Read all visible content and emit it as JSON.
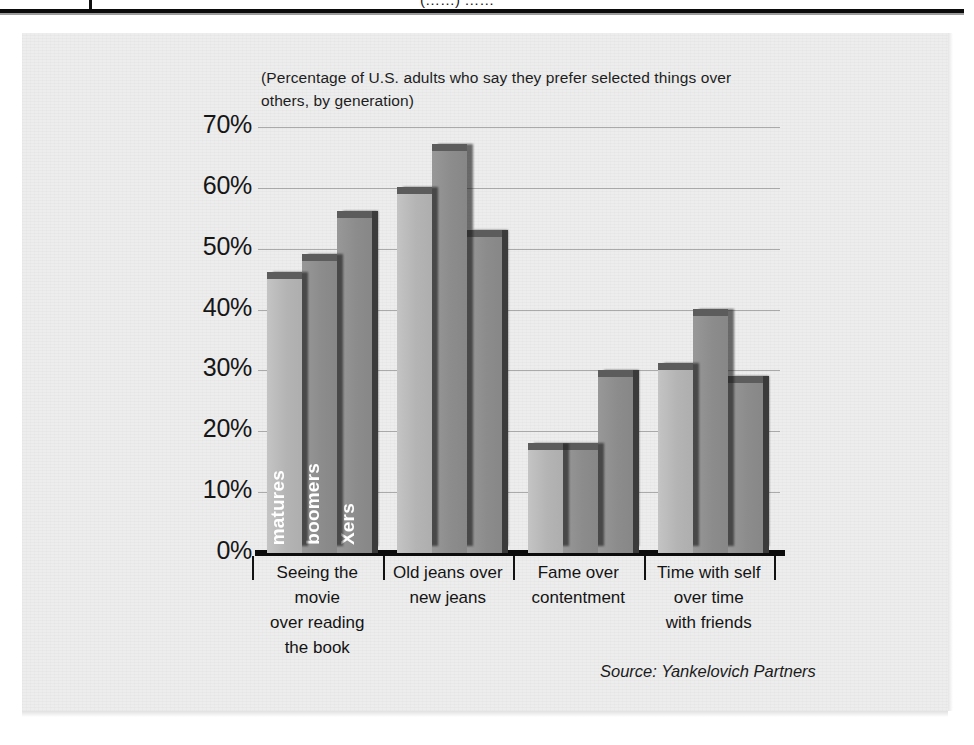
{
  "page": {
    "top_fragment": "(……)  ……",
    "source_note": "Source: Yankelovich Partners"
  },
  "chart_data": {
    "type": "bar",
    "title": "",
    "subtitle": "(Percentage of U.S. adults who say they prefer selected things over others, by generation)",
    "xlabel": "",
    "ylabel": "",
    "ylim": [
      0,
      70
    ],
    "ytick_step": 10,
    "ytick_labels": [
      "70%",
      "60%",
      "50%",
      "40%",
      "30%",
      "20%",
      "10%",
      "0%"
    ],
    "ytick_values": [
      70,
      60,
      50,
      40,
      30,
      20,
      10,
      0
    ],
    "grid": true,
    "legend_position": "in-bar-labels",
    "value_format": "percent",
    "categories": [
      "Seeing the movie over reading the book",
      "Old jeans over new jeans",
      "Fame over contentment",
      "Time with self over time with friends"
    ],
    "category_lines": [
      [
        "Seeing the movie",
        "over reading",
        "the book"
      ],
      [
        "Old jeans over",
        "new jeans"
      ],
      [
        "Fame over",
        "contentment"
      ],
      [
        "Time with self",
        "over time",
        "with friends"
      ]
    ],
    "series": [
      {
        "name": "matures",
        "values": [
          45,
          59,
          17,
          30
        ]
      },
      {
        "name": "boomers",
        "values": [
          48,
          66,
          17,
          39
        ]
      },
      {
        "name": "Xers",
        "values": [
          55,
          52,
          29,
          28
        ]
      }
    ],
    "annotations": [
      "Source: Yankelovich Partners"
    ],
    "colors": {
      "matures": "#b4b4b4",
      "boomers": "#8c8c8c",
      "Xers": "#8c8c8c",
      "panel_background": "#ededed",
      "axis": "#0c0c0c",
      "gridline": "#9d9d9d",
      "text": "#161616",
      "bar_label_text": "#ffffff"
    }
  }
}
